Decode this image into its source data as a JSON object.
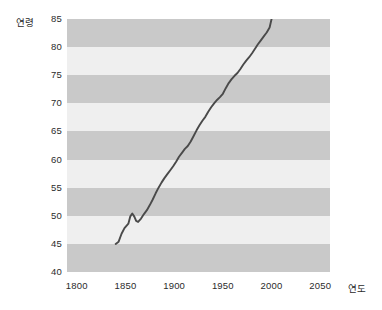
{
  "chart_data": {
    "type": "line",
    "title": "",
    "xlabel": "연도",
    "ylabel": "연령",
    "xlim": [
      1790,
      2060
    ],
    "ylim": [
      40,
      85
    ],
    "xticks": [
      1800,
      1850,
      1900,
      1950,
      2000,
      2050
    ],
    "yticks": [
      40,
      45,
      50,
      55,
      60,
      65,
      70,
      75,
      80,
      85
    ],
    "grid": "horizontal-alternating-bands",
    "legend": "none",
    "series": [
      {
        "name": "기대수명",
        "color": "#4a4a4a",
        "x": [
          1840,
          1843,
          1846,
          1849,
          1851,
          1853,
          1855,
          1857,
          1859,
          1861,
          1863,
          1866,
          1869,
          1872,
          1875,
          1878,
          1881,
          1884,
          1887,
          1890,
          1893,
          1896,
          1899,
          1902,
          1905,
          1908,
          1911,
          1914,
          1917,
          1920,
          1923,
          1926,
          1929,
          1932,
          1935,
          1938,
          1941,
          1944,
          1947,
          1950,
          1953,
          1956,
          1959,
          1962,
          1965,
          1968,
          1971,
          1974,
          1977,
          1980,
          1983,
          1986,
          1989,
          1992,
          1995,
          1998,
          2000
        ],
        "y": [
          45.0,
          45.4,
          46.8,
          47.8,
          48.2,
          48.6,
          49.9,
          50.4,
          49.9,
          49.1,
          48.9,
          49.5,
          50.3,
          51.0,
          51.9,
          52.9,
          54.0,
          55.0,
          55.9,
          56.7,
          57.4,
          58.1,
          58.8,
          59.6,
          60.5,
          61.2,
          61.9,
          62.4,
          63.2,
          64.2,
          65.2,
          66.1,
          66.9,
          67.6,
          68.5,
          69.3,
          70.0,
          70.6,
          71.1,
          71.7,
          72.7,
          73.6,
          74.3,
          74.9,
          75.4,
          76.1,
          76.9,
          77.6,
          78.2,
          78.9,
          79.7,
          80.5,
          81.2,
          81.9,
          82.6,
          83.5,
          85.0
        ]
      }
    ]
  },
  "axes": {
    "y_label_text": "연령",
    "x_label_text": "연도",
    "y_tick_labels": [
      "85",
      "80",
      "75",
      "70",
      "65",
      "60",
      "55",
      "50",
      "45",
      "40"
    ],
    "x_tick_labels": [
      "1800",
      "1850",
      "1900",
      "1950",
      "2000",
      "2050"
    ]
  },
  "colors": {
    "band_dark": "#c9c9c9",
    "band_light": "#efefef",
    "line": "#4a4a4a",
    "text": "#2b2b2b",
    "background": "#ffffff"
  }
}
